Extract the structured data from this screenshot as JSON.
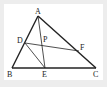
{
  "diagram": {
    "type": "triangle-geometry",
    "colors": {
      "line": "#222222",
      "background": "#ffffff",
      "frame": "#ededed"
    },
    "points": {
      "A": {
        "label": "A",
        "x": 38,
        "y": 16
      },
      "B": {
        "label": "B",
        "x": 12,
        "y": 68
      },
      "C": {
        "label": "C",
        "x": 96,
        "y": 68
      },
      "D": {
        "label": "D",
        "x": 25,
        "y": 43
      },
      "E": {
        "label": "E",
        "x": 45,
        "y": 68
      },
      "F": {
        "label": "F",
        "x": 79,
        "y": 51
      },
      "P": {
        "label": "P",
        "x": 43,
        "y": 46
      }
    },
    "segments": [
      "AB",
      "BC",
      "CA",
      "AE",
      "DE",
      "DF"
    ]
  }
}
